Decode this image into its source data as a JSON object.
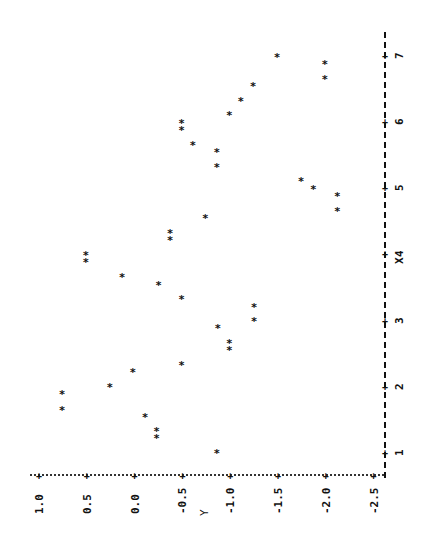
{
  "chart_data": {
    "type": "scatter",
    "orientation": "rotated-90-ccw",
    "title": "",
    "xlabel": "X",
    "ylabel": "Y",
    "marker": "*",
    "x_ticks": [
      1,
      2,
      3,
      4,
      5,
      6,
      7
    ],
    "x_tick_labels": [
      "1",
      "2",
      "3",
      "4",
      "5",
      "6",
      "7"
    ],
    "y_ticks": [
      1.0,
      0.5,
      0.0,
      -0.5,
      -1.0,
      -1.5,
      -2.0,
      -2.5
    ],
    "y_tick_labels": [
      "1.0",
      "0.5",
      "0.0",
      "-0.5",
      "-1.0",
      "-1.5",
      "-2.0",
      "-2.5"
    ],
    "xlim": [
      0.7,
      7.35
    ],
    "ylim": [
      -2.5,
      1.1
    ],
    "grid": false,
    "legend": null,
    "points": [
      {
        "x": 1.0,
        "y": -0.86
      },
      {
        "x": 1.23,
        "y": -0.23
      },
      {
        "x": 1.33,
        "y": -0.23
      },
      {
        "x": 1.54,
        "y": -0.11
      },
      {
        "x": 1.65,
        "y": 0.76
      },
      {
        "x": 1.89,
        "y": 0.76
      },
      {
        "x": 2.0,
        "y": 0.26
      },
      {
        "x": 2.22,
        "y": 0.02
      },
      {
        "x": 2.33,
        "y": -0.49
      },
      {
        "x": 2.56,
        "y": -0.99
      },
      {
        "x": 2.66,
        "y": -0.99
      },
      {
        "x": 2.89,
        "y": -0.87
      },
      {
        "x": 2.99,
        "y": -1.25
      },
      {
        "x": 3.21,
        "y": -1.25
      },
      {
        "x": 3.33,
        "y": -0.49
      },
      {
        "x": 3.54,
        "y": -0.25
      },
      {
        "x": 3.66,
        "y": 0.13
      },
      {
        "x": 3.89,
        "y": 0.51
      },
      {
        "x": 3.99,
        "y": 0.51
      },
      {
        "x": 4.22,
        "y": -0.37
      },
      {
        "x": 4.32,
        "y": -0.37
      },
      {
        "x": 4.55,
        "y": -0.74
      },
      {
        "x": 4.66,
        "y": -2.12
      },
      {
        "x": 4.88,
        "y": -2.12
      },
      {
        "x": 4.99,
        "y": -1.87
      },
      {
        "x": 5.11,
        "y": -1.74
      },
      {
        "x": 5.32,
        "y": -0.86
      },
      {
        "x": 5.55,
        "y": -0.86
      },
      {
        "x": 5.65,
        "y": -0.61
      },
      {
        "x": 5.88,
        "y": -0.49
      },
      {
        "x": 5.98,
        "y": -0.49
      },
      {
        "x": 6.11,
        "y": -0.99
      },
      {
        "x": 6.32,
        "y": -1.11
      },
      {
        "x": 6.54,
        "y": -1.24
      },
      {
        "x": 6.65,
        "y": -1.99
      },
      {
        "x": 6.88,
        "y": -1.99
      },
      {
        "x": 6.98,
        "y": -1.49
      }
    ]
  },
  "layout": {
    "x_axis_px": 384,
    "x1_py": 452,
    "x_unit_px": 66.2,
    "y_axis_py": 474,
    "y1_px": 39,
    "y_unit_px": 95.6
  }
}
